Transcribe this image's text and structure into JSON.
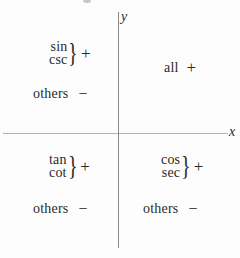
{
  "colors": {
    "background": "#fdfdfd",
    "text": "#2a2a2a",
    "x_axis_line": "#b3b3b3",
    "y_axis_line": "#8a8a8a"
  },
  "axes": {
    "x_label": "x",
    "y_label": "y"
  },
  "glyphs": {
    "brace": "}"
  },
  "quadrants": {
    "q1": {
      "label": "all",
      "sign": "+"
    },
    "q2": {
      "functions": [
        "sin",
        "csc"
      ],
      "sign": "+",
      "others_label": "others",
      "others_sign": "−"
    },
    "q3": {
      "functions": [
        "tan",
        "cot"
      ],
      "sign": "+",
      "others_label": "others",
      "others_sign": "−"
    },
    "q4": {
      "functions": [
        "cos",
        "sec"
      ],
      "sign": "+",
      "others_label": "others",
      "others_sign": "−"
    }
  }
}
